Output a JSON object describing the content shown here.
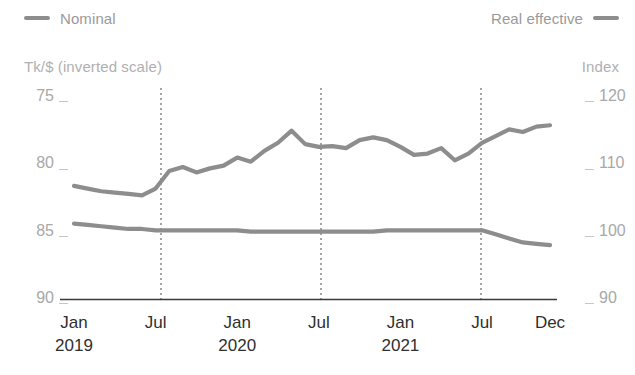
{
  "legend": {
    "nominal": {
      "label": "Nominal",
      "color": "#8d8d8d",
      "icon": "line-swatch"
    },
    "real_effective": {
      "label": "Real effective",
      "color": "#8d8d8d",
      "icon": "line-swatch"
    }
  },
  "axes": {
    "left_title": "Tk/$ (inverted scale)",
    "right_title": "Index",
    "left_ticks": [
      "75",
      "80",
      "85",
      "90"
    ],
    "right_ticks": [
      "120",
      "110",
      "100",
      "90"
    ],
    "x_ticks": [
      {
        "month": "Jan",
        "year": "2019"
      },
      {
        "month": "Jul",
        "year": ""
      },
      {
        "month": "Jan",
        "year": "2020"
      },
      {
        "month": "Jul",
        "year": ""
      },
      {
        "month": "Jan",
        "year": "2021"
      },
      {
        "month": "Jul",
        "year": ""
      },
      {
        "month": "Dec",
        "year": ""
      }
    ]
  },
  "chart_data": {
    "type": "line",
    "title": "",
    "xlabel": "",
    "ylabel": "Tk/$ (inverted scale)",
    "y2label": "Index",
    "ylim": [
      90,
      75
    ],
    "y2lim": [
      90,
      120
    ],
    "y_inverted": true,
    "grid": false,
    "gridlines_vertical": [
      "2019-07",
      "2020-07",
      "2021-07"
    ],
    "legend_position": "top",
    "x": [
      "2019-01",
      "2019-02",
      "2019-03",
      "2019-04",
      "2019-05",
      "2019-06",
      "2019-07",
      "2019-08",
      "2019-09",
      "2019-10",
      "2019-11",
      "2019-12",
      "2020-01",
      "2020-02",
      "2020-03",
      "2020-04",
      "2020-05",
      "2020-06",
      "2020-07",
      "2020-08",
      "2020-09",
      "2020-10",
      "2020-11",
      "2020-12",
      "2021-01",
      "2021-02",
      "2021-03",
      "2021-04",
      "2021-05",
      "2021-06",
      "2021-07",
      "2021-08",
      "2021-09",
      "2021-10",
      "2021-11",
      "2021-12"
    ],
    "series": [
      {
        "name": "Nominal",
        "axis": "left",
        "unit": "Tk/$",
        "color": "#8d8d8d",
        "values": [
          84.4,
          84.5,
          84.6,
          84.7,
          84.8,
          84.8,
          84.9,
          84.9,
          84.9,
          84.9,
          84.9,
          84.9,
          84.9,
          85.0,
          85.0,
          85.0,
          85.0,
          85.0,
          85.0,
          85.0,
          85.0,
          85.0,
          85.0,
          84.9,
          84.9,
          84.9,
          84.9,
          84.9,
          84.9,
          84.9,
          84.9,
          85.2,
          85.5,
          85.8,
          85.9,
          86.0
        ]
      },
      {
        "name": "Real effective",
        "axis": "right",
        "unit": "Index",
        "color": "#8d8d8d",
        "values": [
          106.8,
          106.4,
          106.0,
          105.8,
          105.6,
          105.4,
          106.4,
          109.0,
          109.6,
          108.8,
          109.4,
          109.8,
          111.0,
          110.4,
          112.0,
          113.2,
          115.0,
          113.0,
          112.6,
          112.7,
          112.4,
          113.6,
          114.0,
          113.6,
          112.6,
          111.4,
          111.6,
          112.4,
          110.6,
          111.6,
          113.2,
          114.2,
          115.2,
          114.8,
          115.6,
          115.8
        ]
      }
    ]
  }
}
